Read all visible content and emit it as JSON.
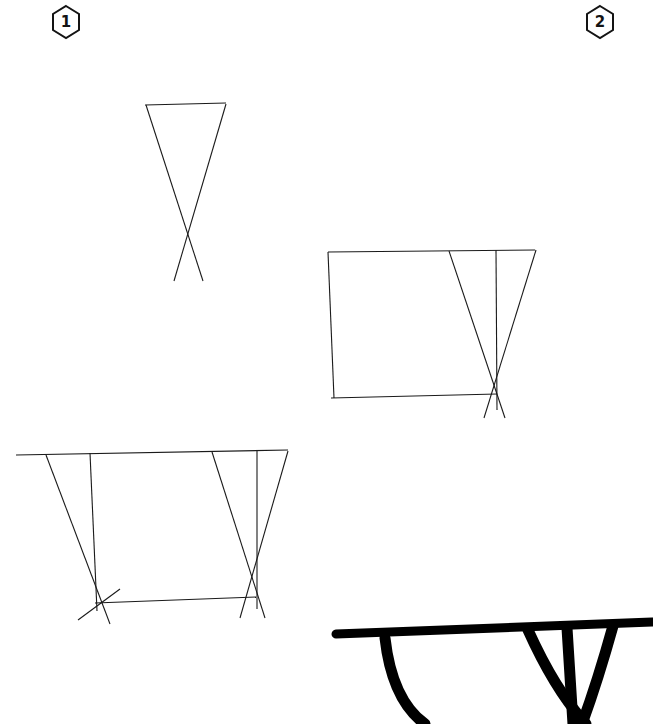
{
  "page": {
    "background_color": "#ffffff",
    "ink_color": "#1a1a1a",
    "bold_ink_color": "#000000",
    "width": 653,
    "height": 724
  },
  "step_badges": [
    {
      "id": "step-1",
      "label": "1",
      "shape": "hexagon",
      "x": 46,
      "y": 2
    },
    {
      "id": "step-2",
      "label": "2",
      "shape": "hexagon",
      "x": 580,
      "y": 2
    }
  ],
  "drawings": [
    {
      "id": "sketch-step-1",
      "caption": "Step 1 - crossed leg guide lines with top edge",
      "stroke_style": "light-pencil",
      "strokes": [
        {
          "name": "tabletop-guide-line",
          "d": "M145,105 L226,103"
        },
        {
          "name": "leg-diagonal-left-to-right",
          "d": "M146,105 L203,281"
        },
        {
          "name": "leg-diagonal-right-to-left",
          "d": "M226,104 L174,281"
        }
      ]
    },
    {
      "id": "sketch-step-2",
      "caption": "Step 2 - tabletop box plus right X-leg with center post",
      "stroke_style": "light-pencil",
      "strokes": [
        {
          "name": "tabletop-top-edge",
          "d": "M328,252 L535,250"
        },
        {
          "name": "tabletop-left-edge",
          "d": "M328,252 L334,398"
        },
        {
          "name": "tabletop-bottom-edge",
          "d": "M331,398 L497,394"
        },
        {
          "name": "right-leg-diagonal-inner",
          "d": "M449,251 L505,418"
        },
        {
          "name": "right-leg-diagonal-outer",
          "d": "M536,250 L484,418"
        },
        {
          "name": "right-leg-center-post",
          "d": "M496,250 L497,410"
        }
      ]
    },
    {
      "id": "sketch-step-3",
      "caption": "Step 3 - full table sketch, two X-legs and stretcher",
      "stroke_style": "light-pencil",
      "strokes": [
        {
          "name": "tabletop-top-edge",
          "d": "M16,455 L288,450"
        },
        {
          "name": "left-leg-diagonal-outer",
          "d": "M46,455 L110,624"
        },
        {
          "name": "left-leg-center-post",
          "d": "M90,453 L97,611"
        },
        {
          "name": "left-leg-diagonal-inner",
          "d": "M78,620 L120,589"
        },
        {
          "name": "stretcher-bar",
          "d": "M95,603 L256,597"
        },
        {
          "name": "right-leg-diagonal-inner",
          "d": "M212,452 L265,618"
        },
        {
          "name": "right-leg-diagonal-outer",
          "d": "M288,451 L240,618"
        },
        {
          "name": "right-leg-center-post",
          "d": "M257,451 L257,609"
        }
      ]
    },
    {
      "id": "inked-step-4",
      "caption": "Step 4 - final inked table, cropped by page edge",
      "stroke_style": "bold-ink",
      "strokes": [
        {
          "name": "tabletop-slab",
          "d": "M336,634 L652,622"
        },
        {
          "name": "left-leg-bold",
          "d": "M385,638 Q392,700 425,724"
        },
        {
          "name": "right-leg-diagonal-inner-bold",
          "d": "M528,630 Q555,690 586,724"
        },
        {
          "name": "right-leg-center-post-bold",
          "d": "M567,628 L573,724"
        },
        {
          "name": "right-leg-diagonal-outer-bold",
          "d": "M613,626 Q598,680 582,724"
        }
      ]
    }
  ]
}
